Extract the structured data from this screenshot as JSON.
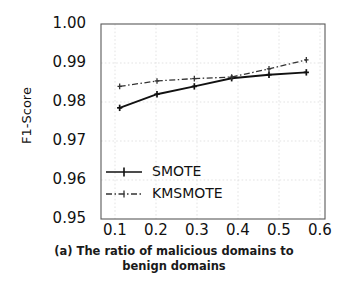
{
  "chart_data": {
    "type": "line",
    "title": "",
    "caption": "(a) The ratio of malicious domains to benign domains",
    "caption_line1": "(a) The ratio of malicious domains to",
    "caption_line2": "benign domains",
    "xlabel": "",
    "ylabel": "F1-Score",
    "x": [
      0.1,
      0.2,
      0.3,
      0.4,
      0.5,
      0.6
    ],
    "xtick_labels": [
      "0.1",
      "0.2",
      "0.3",
      "0.4",
      "0.5",
      "0.6"
    ],
    "ytick_labels": [
      "0.95",
      "0.96",
      "0.97",
      "0.98",
      "0.99",
      "1.00"
    ],
    "ytick_values": [
      0.95,
      0.96,
      0.97,
      0.98,
      0.99,
      1.0
    ],
    "xlim": [
      0.05,
      0.65
    ],
    "ylim": [
      0.95,
      1.0
    ],
    "grid": true,
    "legend_position": "center-left",
    "series": [
      {
        "name": "SMOTE",
        "linestyle": "solid",
        "marker": "plus",
        "color": "#111111",
        "values": [
          0.9785,
          0.982,
          0.984,
          0.9861,
          0.987,
          0.9876
        ]
      },
      {
        "name": "KMSMOTE",
        "linestyle": "dashdot",
        "marker": "plus",
        "color": "#333333",
        "values": [
          0.984,
          0.9854,
          0.986,
          0.9864,
          0.9885,
          0.9908
        ]
      }
    ]
  },
  "legend": {
    "items": [
      {
        "label": "SMOTE"
      },
      {
        "label": "KMSMOTE"
      }
    ]
  },
  "axes": {
    "ylabel": "F1-Score",
    "ytick_labels": [
      "1.00",
      "0.99",
      "0.98",
      "0.97",
      "0.96",
      "0.95"
    ],
    "xtick_labels": [
      "0.1",
      "0.2",
      "0.3",
      "0.4",
      "0.5",
      "0.6"
    ]
  },
  "caption": {
    "line1": "(a) The ratio of malicious domains to",
    "line2": "benign domains"
  },
  "colors": {
    "background": "#ffffff",
    "axis": "#4a4a4a",
    "grid": "#d8d8d8",
    "series_smote": "#111111",
    "series_kmsmote": "#333333",
    "text": "#111111"
  }
}
